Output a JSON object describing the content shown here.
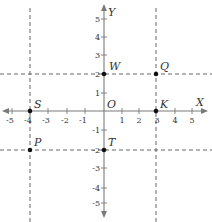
{
  "diagram": {
    "type": "coordinate-plane",
    "axes": {
      "x_label": "X",
      "y_label": "Y",
      "origin_label": "O",
      "x_range": [
        -5,
        5
      ],
      "y_range": [
        -5,
        5
      ],
      "x_ticks": [
        "-5",
        "-4",
        "-3",
        "-2",
        "-1",
        "1",
        "2",
        "3",
        "4",
        "5"
      ],
      "y_ticks": [
        "5",
        "4",
        "3",
        "2",
        "1",
        "-1",
        "-2",
        "-3",
        "-4",
        "-5"
      ]
    },
    "points": [
      {
        "label": "W",
        "x": 0,
        "y": 2
      },
      {
        "label": "Q",
        "x": 3,
        "y": 2
      },
      {
        "label": "S",
        "x": -4,
        "y": 0
      },
      {
        "label": "K",
        "x": 3,
        "y": 0
      },
      {
        "label": "P",
        "x": -4,
        "y": -2
      },
      {
        "label": "T",
        "x": 0,
        "y": -2
      }
    ],
    "dashed_lines": [
      {
        "orientation": "vertical",
        "at": -4
      },
      {
        "orientation": "vertical",
        "at": 3
      },
      {
        "orientation": "horizontal",
        "at": 2
      },
      {
        "orientation": "horizontal",
        "at": -2
      }
    ],
    "colors": {
      "axis": "#7a7a7a",
      "dashed": "#555555",
      "point": "#111111",
      "text": "#333333"
    }
  }
}
